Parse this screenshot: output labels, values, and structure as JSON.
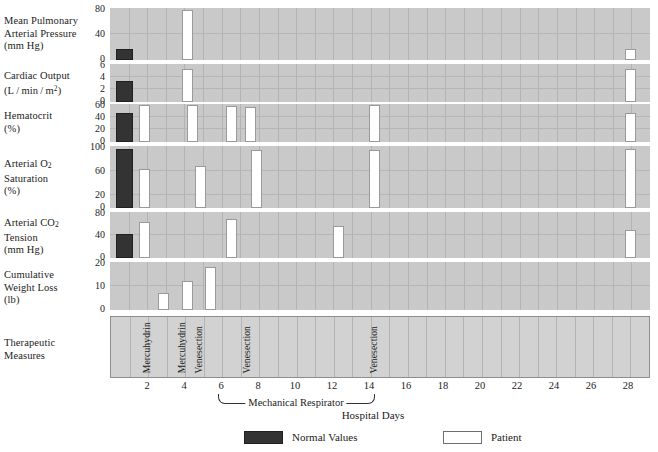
{
  "figure": {
    "x_axis_title": "Hospital Days",
    "respirator_annotation": "Mechanical Respirator",
    "respirator_span_days": [
      6,
      14
    ],
    "x_tick_labels": [
      "2",
      "4",
      "6",
      "8",
      "10",
      "12",
      "14",
      "16",
      "18",
      "20",
      "22",
      "24",
      "26",
      "28"
    ],
    "x_tick_values": [
      2,
      4,
      6,
      8,
      10,
      12,
      14,
      16,
      18,
      20,
      22,
      24,
      26,
      28
    ],
    "x_range": [
      0,
      29
    ]
  },
  "legend": {
    "normal_label": "Normal Values",
    "patient_label": "Patient",
    "normal_color": "#333333",
    "patient_color": "#ffffff"
  },
  "rows": {
    "pulmonary": {
      "label_lines": [
        "Mean Pulmonary",
        "Arterial Pressure",
        "(mm Hg)"
      ],
      "ticks": [
        "80",
        "40",
        "0"
      ]
    },
    "cardiac": {
      "label_lines": [
        "Cardiac Output",
        "(L / min / m²)"
      ],
      "ticks": [
        "6",
        "4",
        "2",
        "0"
      ]
    },
    "hematocrit": {
      "label_lines": [
        "Hematocrit",
        "(%)"
      ],
      "ticks": [
        "60",
        "40",
        "20",
        "0"
      ]
    },
    "o2sat": {
      "label_lines": [
        "Arterial O₂",
        "Saturation",
        "(%)"
      ],
      "ticks": [
        "100",
        "60",
        "20",
        "0"
      ]
    },
    "co2tension": {
      "label_lines": [
        "Arterial CO₂",
        "Tension",
        "(mm Hg)"
      ],
      "ticks": [
        "80",
        "40",
        "0"
      ]
    },
    "weightloss": {
      "label_lines": [
        "Cumulative",
        "Weight Loss",
        "(lb)"
      ],
      "ticks": [
        "20",
        "10",
        "0"
      ]
    },
    "therapy": {
      "label_lines": [
        "Therapeutic",
        "Measures"
      ]
    }
  },
  "therapy_events": [
    {
      "day": 2,
      "label": "Mercuhydrin"
    },
    {
      "day": 3.5,
      "label": "Mercuhydrin"
    },
    {
      "day": 4.4,
      "label": "Venesection"
    },
    {
      "day": 7,
      "label": "Venesection"
    },
    {
      "day": 14,
      "label": "Venesection"
    }
  ],
  "chart_data": {
    "type": "bar",
    "title": "",
    "xlabel": "Hospital Days",
    "grid": true,
    "legend_position": "bottom",
    "x_range": [
      0,
      29
    ],
    "annotations": [
      {
        "text": "Mechanical Respirator",
        "x_start": 6,
        "x_end": 14
      }
    ],
    "panels": [
      {
        "name": "pulmonary",
        "ylabel": "Mean Pulmonary Arterial Pressure (mm Hg)",
        "units": "mm Hg",
        "ylim": [
          0,
          80
        ],
        "yticks": [
          0,
          40,
          80
        ],
        "normal_value": 14,
        "series": [
          {
            "name": "Patient",
            "points": [
              {
                "day": 4,
                "value": 78
              },
              {
                "day": 28,
                "value": 14
              }
            ]
          }
        ]
      },
      {
        "name": "cardiac_output",
        "ylabel": "Cardiac Output (L / min / m²)",
        "units": "L/min/m2",
        "ylim": [
          0,
          6
        ],
        "yticks": [
          0,
          2,
          4,
          6
        ],
        "normal_value": 3.2,
        "series": [
          {
            "name": "Patient",
            "points": [
              {
                "day": 4,
                "value": 5.4
              },
              {
                "day": 28,
                "value": 5.4
              }
            ]
          }
        ]
      },
      {
        "name": "hematocrit",
        "ylabel": "Hematocrit (%)",
        "units": "%",
        "ylim": [
          0,
          60
        ],
        "yticks": [
          0,
          20,
          40,
          60
        ],
        "normal_value": 45,
        "series": [
          {
            "name": "Patient",
            "points": [
              {
                "day": 1.6,
                "value": 58
              },
              {
                "day": 4.2,
                "value": 58
              },
              {
                "day": 6.3,
                "value": 56
              },
              {
                "day": 7.3,
                "value": 55
              },
              {
                "day": 14,
                "value": 58
              },
              {
                "day": 28,
                "value": 45
              }
            ]
          }
        ]
      },
      {
        "name": "arterial_o2_saturation",
        "ylabel": "Arterial O₂ Saturation (%)",
        "units": "%",
        "ylim": [
          0,
          100
        ],
        "yticks": [
          0,
          20,
          60,
          100
        ],
        "normal_value": 96,
        "series": [
          {
            "name": "Patient",
            "points": [
              {
                "day": 1.6,
                "value": 64
              },
              {
                "day": 7,
                "value": 68
              },
              {
                "day": 10.3,
                "value": 94
              },
              {
                "day": 14,
                "value": 94
              },
              {
                "day": 28,
                "value": 96
              }
            ]
          }
        ]
      },
      {
        "name": "arterial_co2_tension",
        "ylabel": "Arterial CO₂ Tension (mm Hg)",
        "units": "mm Hg",
        "ylim": [
          0,
          80
        ],
        "yticks": [
          0,
          40,
          80
        ],
        "normal_value": 42,
        "series": [
          {
            "name": "Patient",
            "points": [
              {
                "day": 1.6,
                "value": 62
              },
              {
                "day": 6.3,
                "value": 68
              },
              {
                "day": 10.3,
                "value": 56
              },
              {
                "day": 28,
                "value": 48
              }
            ]
          }
        ]
      },
      {
        "name": "cumulative_weight_loss",
        "ylabel": "Cumulative Weight Loss (lb)",
        "units": "lb",
        "ylim": [
          0,
          20
        ],
        "yticks": [
          0,
          10,
          20
        ],
        "normal_value": null,
        "series": [
          {
            "name": "Patient",
            "points": [
              {
                "day": 2.6,
                "value": 7
              },
              {
                "day": 4,
                "value": 12
              },
              {
                "day": 5.2,
                "value": 18
              }
            ]
          }
        ]
      }
    ]
  }
}
